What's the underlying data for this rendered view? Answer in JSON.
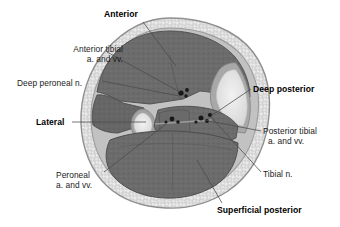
{
  "figure": {
    "type": "anatomical-cross-section",
    "background_color": "#ffffff",
    "colors": {
      "skin_outline": "#8a8a8a",
      "fat_layer": "#cfcfcf",
      "fascia": "#b0b0b0",
      "muscle": "#6e6e6e",
      "muscle_dark": "#5f5f5f",
      "bone_cortex": "#9a9a9a",
      "bone_marrow": "#e6e6e6",
      "vessel": "#1c1c1c",
      "leader_line": "#4a4a4a",
      "text": "#1a1a1a"
    }
  },
  "labels": {
    "anterior": {
      "text": "Anterior",
      "bold": true,
      "x": 104,
      "y": 9
    },
    "anterior_tibial": {
      "line1": "Anterior tibial",
      "line2": "a. and vv.",
      "bold": false,
      "x": 39,
      "y": 44
    },
    "deep_peroneal": {
      "text": "Deep peroneal n.",
      "bold": false,
      "x": 17,
      "y": 78
    },
    "lateral": {
      "text": "Lateral",
      "bold": true,
      "x": 36,
      "y": 119
    },
    "peroneal": {
      "line1": "Peroneal",
      "line2": "a. and vv.",
      "bold": false,
      "x": 56,
      "y": 173
    },
    "deep_posterior": {
      "text": "Deep posterior",
      "bold": true,
      "x": 253,
      "y": 85
    },
    "posterior_tibial": {
      "line1": "Posterior tibial",
      "line2": "a. and vv.",
      "bold": false,
      "x": 263,
      "y": 129
    },
    "tibial_nerve": {
      "text": "Tibial n.",
      "bold": false,
      "x": 263,
      "y": 172
    },
    "superficial_posterior": {
      "text": "Superficial posterior",
      "bold": true,
      "x": 217,
      "y": 208
    }
  },
  "structures": [
    {
      "name": "skin-and-fat-rim",
      "kind": "fat",
      "description": "speckled subcutaneous fat layer surrounding the whole section"
    },
    {
      "name": "anterior-compartment-muscle",
      "kind": "muscle",
      "description": "large dark muscle mass at top"
    },
    {
      "name": "lateral-compartment-muscle",
      "kind": "muscle",
      "description": "muscle on left lateral side"
    },
    {
      "name": "deep-posterior-compartment-muscle",
      "kind": "muscle",
      "description": "muscles deep to the interosseous region"
    },
    {
      "name": "superficial-posterior-compartment-muscle",
      "kind": "muscle",
      "description": "large gastrocnemius/soleus mass at bottom"
    },
    {
      "name": "tibia",
      "kind": "bone",
      "description": "triangular bone on the right/medial side"
    },
    {
      "name": "fibula",
      "kind": "bone",
      "description": "small oval bone on the left/lateral side"
    },
    {
      "name": "anterior-tibial-vessels",
      "kind": "vessel",
      "description": "vessel dots in the anterior compartment"
    },
    {
      "name": "peroneal-vessels",
      "kind": "vessel",
      "description": "vessel dots near the fibula"
    },
    {
      "name": "posterior-tibial-vessels",
      "kind": "vessel",
      "description": "vessel dots in the deep posterior compartment"
    },
    {
      "name": "tibial-nerve",
      "kind": "vessel",
      "description": "nerve dot in the deep posterior compartment"
    }
  ]
}
